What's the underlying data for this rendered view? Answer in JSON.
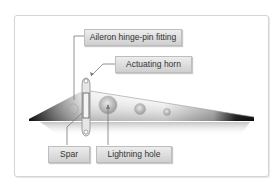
{
  "diagram": {
    "labels": {
      "hinge_pin_fitting": "Aileron hinge-pin fitting",
      "actuating_horn": "Actuating horn",
      "spar": "Spar",
      "lightning_hole": "Lightning hole"
    },
    "colors": {
      "frame_border": "#d4d4d4",
      "label_bg_top": "#ededed",
      "label_bg_bottom": "#cfcfcf",
      "label_border": "#bdbdbd",
      "leader_line": "#777777",
      "wing_dark": "#111111"
    }
  }
}
